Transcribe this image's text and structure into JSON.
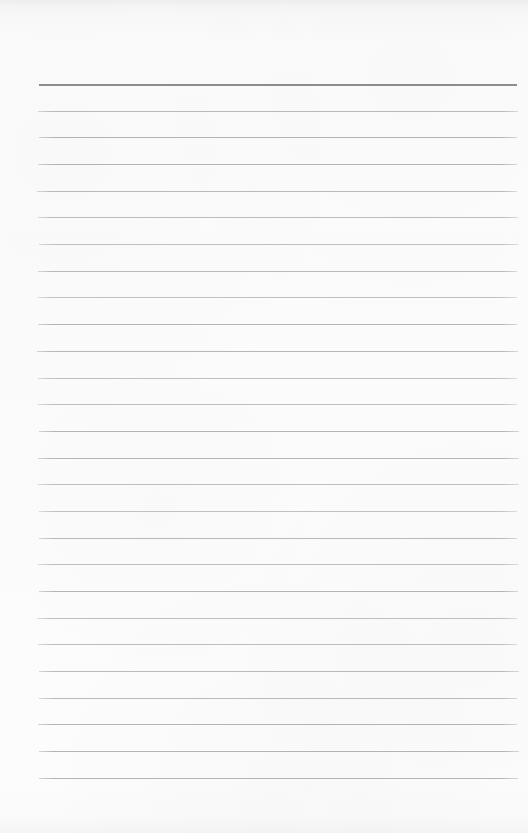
{
  "document": {
    "kind": "lined-paper",
    "title": "Blank lined paper",
    "page_width": 528,
    "page_height": 833,
    "background_color": "#fbfbfb",
    "body_text": "",
    "has_text_content": false
  },
  "rules": {
    "count": 27,
    "left_x": 38,
    "right_x": 518,
    "line_length": 480,
    "first_line_y": 84,
    "last_line_y": 778,
    "spacing": 26.7,
    "header_line_color": "#8d8d8d",
    "header_line_thickness": 2,
    "body_line_color": "#b4b4b4",
    "body_line_thickness": 1,
    "positions": [
      84,
      111,
      137,
      164,
      191,
      217,
      244,
      271,
      297,
      324,
      351,
      378,
      404,
      431,
      458,
      484,
      511,
      538,
      564,
      591,
      618,
      644,
      671,
      698,
      724,
      751,
      778
    ],
    "styles": [
      "header",
      "body",
      "body",
      "body",
      "body",
      "body",
      "body",
      "body",
      "body",
      "body",
      "body",
      "body",
      "body",
      "body",
      "body",
      "body",
      "body",
      "body",
      "body",
      "body",
      "body",
      "body",
      "body",
      "body",
      "body",
      "body",
      "body"
    ]
  },
  "margins": {
    "top_blank_height": 84,
    "bottom_blank_height": 55,
    "left_blank_width": 38,
    "right_blank_width": 10,
    "has_vertical_margin_rule": false
  }
}
